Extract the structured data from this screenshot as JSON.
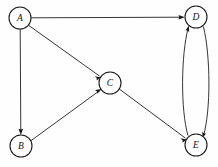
{
  "diagram": {
    "type": "directed-graph",
    "canvas": {
      "width": 218,
      "height": 167,
      "background": "#fefefe"
    },
    "style": {
      "node_fill": "#ffffff",
      "node_stroke": "#1a1a1a",
      "edge_color": "#2b2b2b",
      "label_color": "#111111",
      "node_radius": 11
    },
    "nodes": [
      {
        "id": "A",
        "label": "A",
        "x": 20,
        "y": 18
      },
      {
        "id": "B",
        "label": "B",
        "x": 21,
        "y": 146
      },
      {
        "id": "C",
        "label": "C",
        "x": 110,
        "y": 83
      },
      {
        "id": "D",
        "label": "D",
        "x": 196,
        "y": 17
      },
      {
        "id": "E",
        "label": "E",
        "x": 196,
        "y": 145
      }
    ],
    "edges": [
      {
        "from": "A",
        "to": "D",
        "shape": "straight",
        "directed": true
      },
      {
        "from": "A",
        "to": "B",
        "shape": "straight",
        "directed": true
      },
      {
        "from": "A",
        "to": "C",
        "shape": "straight",
        "directed": true
      },
      {
        "from": "B",
        "to": "C",
        "shape": "straight",
        "directed": true
      },
      {
        "from": "C",
        "to": "E",
        "shape": "straight",
        "directed": true
      },
      {
        "from": "D",
        "to": "E",
        "shape": "curved-right",
        "directed": true
      },
      {
        "from": "E",
        "to": "D",
        "shape": "curved-left",
        "directed": true
      }
    ],
    "labels": {
      "a": "A",
      "b": "B",
      "c": "C",
      "d": "D",
      "e": "E"
    }
  }
}
